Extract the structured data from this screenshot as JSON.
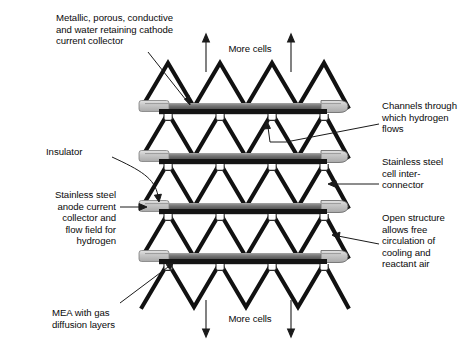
{
  "figure": {
    "background_color": "#ffffff",
    "width": 476,
    "height": 352
  },
  "colors": {
    "plate_dark": "#141414",
    "plate_mid": "#565656",
    "plate_light": "#b5b5b5",
    "plate_lighter": "#d2d2d2",
    "zigzag": "#111111",
    "leader": "#1a1a1a",
    "text": "#0a0a0a"
  },
  "labels": {
    "cathode_collector": "Metallic, porous, conductive\nand water retaining cathode\ncurrent collector",
    "insulator": "Insulator",
    "anode_collector": "Stainless steel\nanode current\ncollector and\nflow field for\nhydrogen",
    "mea": "MEA with gas\ndiffusion layers",
    "channels": "Channels through\nwhich hydrogen\nflows",
    "interconnector": "Stainless steel\ncell inter-\nconnector",
    "open_structure": "Open structure\nallows free\ncirculation of\ncooling and\nreactant air",
    "more_cells_top": "More cells",
    "more_cells_bottom": "More cells"
  },
  "stack": {
    "plate_count": 4,
    "plate_y": [
      107,
      157,
      207,
      257
    ],
    "plate_left": 139,
    "plate_right": 348,
    "zigzag_layers": 5,
    "zigzag_periods": 4,
    "channel_loops_per_plate": 4
  },
  "arrows": {
    "top_direction": "up",
    "bottom_direction": "down",
    "top_count": 2,
    "bottom_count": 2
  }
}
